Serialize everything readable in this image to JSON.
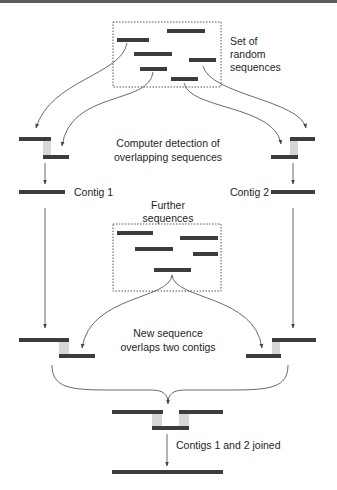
{
  "diagram": {
    "colors": {
      "sequence_bar": "#3c3c3c",
      "box_border": "#555555",
      "arrow": "#444444",
      "overlap_lines": "#9a9a9a",
      "text": "#1e1e1e",
      "top_bar": "#5a5a5a"
    },
    "labels": {
      "random_set_line1": "Set of",
      "random_set_line2": "random",
      "random_set_line3": "sequences",
      "detection_line1": "Computer detection of",
      "detection_line2": "overlapping sequences",
      "contig1": "Contig  1",
      "contig2": "Contig  2",
      "further_line1": "Further",
      "further_line2": "sequences",
      "new_seq_line1": "New sequence",
      "new_seq_line2": "overlaps two contigs",
      "joined": "Contigs 1 and 2 joined"
    },
    "stages": [
      {
        "name": "random-sequences",
        "sequence_count": 7
      },
      {
        "name": "overlap-detection",
        "pairs": 2
      },
      {
        "name": "contigs",
        "count": 2
      },
      {
        "name": "further-sequences",
        "sequence_count": 5
      },
      {
        "name": "new-sequence-overlap"
      },
      {
        "name": "joined-contig"
      }
    ]
  }
}
